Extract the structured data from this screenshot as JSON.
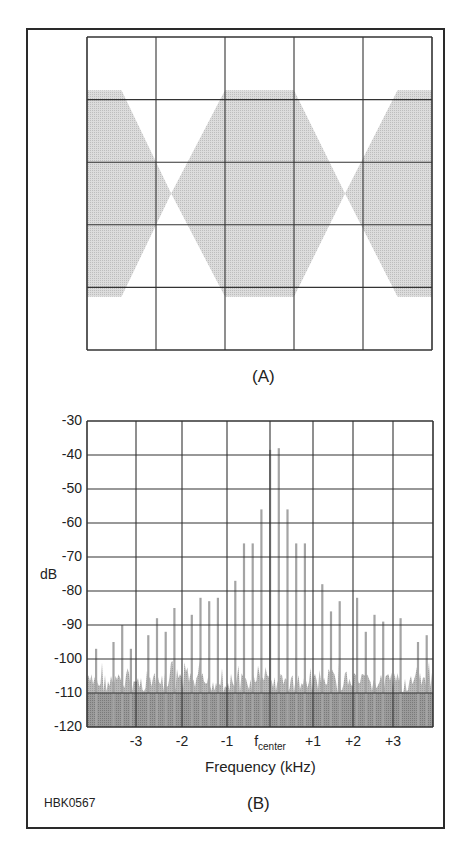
{
  "figure_id": "HBK0567",
  "panels": {
    "A": {
      "label": "(A)"
    },
    "B": {
      "label": "(B)"
    }
  },
  "colors": {
    "frame": "#2a2a2a",
    "grid": "#333333",
    "envelope_fill": "#d4d4d4",
    "spike": "#a8a8a8",
    "noise": "#b0b0b0",
    "floor": "#8c8c8c"
  },
  "chart_data": [
    {
      "panel": "A",
      "type": "area",
      "title": "(A)",
      "description": "Oscilloscope-style envelope display of a two-tone modulated signal showing periodic amplitude envelope with nulls",
      "xlabel": "",
      "ylabel": "",
      "grid": {
        "cols": 5,
        "rows": 5,
        "on": true
      },
      "envelope": {
        "x_divisions": [
          0,
          0.5,
          1.22,
          2.0,
          3.0,
          3.74,
          4.5,
          5.0
        ],
        "upper": [
          0.66,
          0.66,
          0.0,
          0.66,
          0.66,
          0.0,
          0.66,
          0.66
        ],
        "lower": [
          -0.66,
          -0.66,
          0.0,
          -0.66,
          -0.66,
          0.0,
          -0.66,
          -0.66
        ],
        "ylim": [
          -1,
          1
        ]
      }
    },
    {
      "panel": "B",
      "type": "bar",
      "title": "(B)",
      "xlabel": "Frequency (kHz)",
      "ylabel": "dB",
      "ylim": [
        -120,
        -30
      ],
      "yticks": [
        "-30",
        "-40",
        "-50",
        "-60",
        "-70",
        "-80",
        "-90",
        "-100",
        "-110",
        "-120"
      ],
      "xticks": [
        {
          "label": "-3",
          "sub": ""
        },
        {
          "label": "-2",
          "sub": ""
        },
        {
          "label": "-1",
          "sub": ""
        },
        {
          "label": "f",
          "sub": "center"
        },
        {
          "label": "+1",
          "sub": ""
        },
        {
          "label": "+2",
          "sub": ""
        },
        {
          "label": "+3",
          "sub": ""
        }
      ],
      "grid": {
        "on": true
      },
      "noise_floor_db": -104,
      "floor_fill_db": -110,
      "spikes": {
        "x_khz": [
          -4.0,
          -3.6,
          -3.4,
          -3.2,
          -2.8,
          -2.6,
          -2.4,
          -2.2,
          -1.8,
          -1.6,
          -1.4,
          -1.2,
          -0.8,
          -0.6,
          -0.4,
          -0.2,
          0.0,
          0.2,
          0.4,
          0.6,
          0.8,
          1.2,
          1.4,
          1.6,
          2.0,
          2.2,
          2.4,
          2.6,
          3.0,
          3.4,
          3.6
        ],
        "db": [
          -97,
          -95,
          -90,
          -97,
          -93,
          -88,
          -92,
          -85,
          -87,
          -82,
          -83,
          -82,
          -77,
          -66,
          -66,
          -56,
          -38.5,
          -38,
          -56,
          -66,
          -66,
          -78,
          -86,
          -83,
          -82,
          -92,
          -87,
          -89,
          -88,
          -95,
          -93
        ]
      }
    }
  ]
}
